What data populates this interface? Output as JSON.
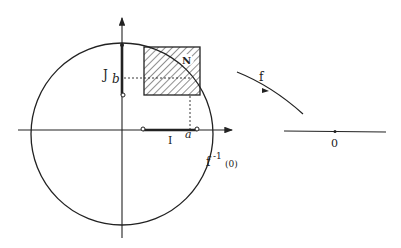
{
  "diagram": {
    "labels": {
      "J": "J",
      "b": "b",
      "N": "N",
      "f": "f",
      "I": "I",
      "a": "a",
      "preimage": "f",
      "preimage_exp": "-1",
      "preimage_arg": "(0)",
      "zero": "0"
    },
    "colors": {
      "stroke": "#222222",
      "background": "#ffffff"
    }
  }
}
